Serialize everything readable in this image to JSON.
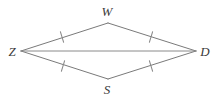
{
  "figure": {
    "background_color": "#ffffff",
    "stroke_color": "#7a7a7a",
    "label_color": "#3a3a3a",
    "labels": {
      "top": "W",
      "left": "Z",
      "right": "D",
      "bottom": "S"
    },
    "vertices": [
      {
        "name": "W",
        "x": 108,
        "y": 23,
        "label_x": 107,
        "label_y": 15
      },
      {
        "name": "Z",
        "x": 21,
        "y": 51,
        "label_x": 12,
        "label_y": 56
      },
      {
        "name": "D",
        "x": 196,
        "y": 51,
        "label_x": 205,
        "label_y": 56
      },
      {
        "name": "S",
        "x": 108,
        "y": 79,
        "label_x": 107,
        "label_y": 93
      }
    ],
    "segments": [
      {
        "name": "ZW",
        "x1": 21,
        "y1": 51,
        "x2": 108,
        "y2": 23,
        "ticks": 1
      },
      {
        "name": "WD",
        "x1": 108,
        "y1": 23,
        "x2": 196,
        "y2": 51,
        "ticks": 1
      },
      {
        "name": "ZS",
        "x1": 21,
        "y1": 51,
        "x2": 108,
        "y2": 79,
        "ticks": 1
      },
      {
        "name": "SD",
        "x1": 108,
        "y1": 79,
        "x2": 196,
        "y2": 51,
        "ticks": 1
      },
      {
        "name": "ZD",
        "x1": 21,
        "y1": 51,
        "x2": 196,
        "y2": 51,
        "ticks": 0
      }
    ],
    "tick_marks": [
      {
        "name": "tick-ZW",
        "cx": 62,
        "cy": 37,
        "angle": -72
      },
      {
        "name": "tick-WD",
        "cx": 151,
        "cy": 37,
        "angle": 72
      },
      {
        "name": "tick-ZS",
        "cx": 63,
        "cy": 66,
        "angle": 72
      },
      {
        "name": "tick-SD",
        "cx": 151,
        "cy": 66,
        "angle": -72
      }
    ]
  }
}
